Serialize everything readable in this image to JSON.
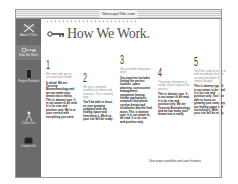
{
  "window": {
    "title": "NetscapeTitle.com"
  },
  "sidebar": {
    "items": [
      {
        "label": "About TCDin",
        "icon": "logo-x-icon"
      },
      {
        "label": "How We Work",
        "icon": "key-icon",
        "active": true
      },
      {
        "label": "Project Portfolio",
        "icon": "book-icon"
      },
      {
        "label": "Client List",
        "icon": "person-icon"
      },
      {
        "label": "Contact Us",
        "icon": "phone-icon"
      }
    ]
  },
  "main": {
    "title": "How We Work.",
    "steps": [
      {
        "number": "1",
        "intro": "We meet with you to ascertain your needs.",
        "body": "In detail. We are Turnstep Biomechanology and we can make your dream into a reality. This is dummy type. It is not meant to be read. It is for size and position only. We're at your service with everything you need."
      },
      {
        "number": "2",
        "intro": "We get a complete schedule of events and activities. This is dummy type.",
        "body": "You'll be able to focus on your growing company with our finding space and furnishing it. Wish us, your site will be ready."
      },
      {
        "number": "3",
        "intro": "We assemble the project team.",
        "body": "Our expertise includes finding the perfect location, space planning, construction management, equipment leasing, freebie applications, computer and phone system design and installation and the final move. This is dummy type. It is not meant to be read. It is for size and position only."
      },
      {
        "number": "4",
        "intro": "The project becomes a reality: every stage of the process.",
        "body": "This is dummy type. It is not meant to be read. It is for size and position only. We are Turnstep Biotechnology and we can make your dream into a reality."
      },
      {
        "number": "5",
        "intro": "You'll be ready to move in with everything finished, on time and within the original budget.",
        "body": "This is dummy type. It is not meant to be read. It is for size and position only. You'll be able to focus on growing your company, not finding space and furnishing it. With us, your site will be ready."
      }
    ],
    "footer_note": "See project portfolio and case histories"
  }
}
